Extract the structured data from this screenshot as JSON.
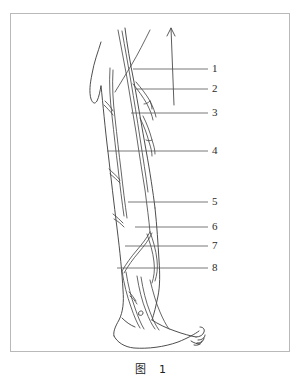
{
  "figure": {
    "caption": "图　1",
    "frame_color": "#b9b9b9",
    "background_color": "#ffffff",
    "ink_color": "#3a3a3a",
    "leader_color": "#555555",
    "title_alt": "Lateral view of the lower limb with numbered structures"
  },
  "labels": [
    {
      "id": "1",
      "text": "1",
      "x": 212,
      "y": 63,
      "leader_from_x": 133,
      "leader_y": 69,
      "leader_to_x": 208
    },
    {
      "id": "2",
      "text": "2",
      "x": 212,
      "y": 83,
      "leader_from_x": 136,
      "leader_y": 89,
      "leader_to_x": 208
    },
    {
      "id": "3",
      "text": "3",
      "x": 212,
      "y": 107,
      "leader_from_x": 131,
      "leader_y": 113,
      "leader_to_x": 208
    },
    {
      "id": "4",
      "text": "4",
      "x": 212,
      "y": 145,
      "leader_from_x": 107,
      "leader_y": 151,
      "leader_to_x": 208
    },
    {
      "id": "5",
      "text": "5",
      "x": 212,
      "y": 196,
      "leader_from_x": 128,
      "leader_y": 202,
      "leader_to_x": 208
    },
    {
      "id": "6",
      "text": "6",
      "x": 212,
      "y": 221,
      "leader_from_x": 135,
      "leader_y": 227,
      "leader_to_x": 208
    },
    {
      "id": "7",
      "text": "7",
      "x": 212,
      "y": 240,
      "leader_from_x": 125,
      "leader_y": 246,
      "leader_to_x": 208
    },
    {
      "id": "8",
      "text": "8",
      "x": 212,
      "y": 262,
      "leader_from_x": 117,
      "leader_y": 268,
      "leader_to_x": 208
    }
  ],
  "annotations": {
    "arrow": {
      "name": "upward-arrow",
      "x": 172,
      "y_top": 28,
      "y_bottom": 105
    }
  }
}
